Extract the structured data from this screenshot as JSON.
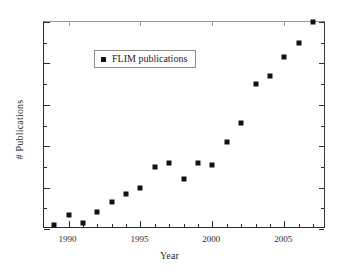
{
  "chart_data": {
    "type": "scatter",
    "title": "",
    "xlabel": "Year",
    "ylabel": "# Publications",
    "legend": [
      "FLIM publications"
    ],
    "legend_position": "top-left",
    "grid": false,
    "marker": "filled-square",
    "marker_color": "#111111",
    "xlim": [
      1988.3,
      2007.9
    ],
    "ylim": [
      0,
      100
    ],
    "x_major_ticks": [
      1990,
      1995,
      2000,
      2005
    ],
    "x_tick_labels": [
      "1990",
      "1995",
      "2000",
      "2005"
    ],
    "x_minor_tick_step": 1,
    "y_tick_labels": [],
    "y_axis_labeled": false,
    "y_major_tick_count": 5,
    "y_minor_tick_count": 5,
    "x": [
      1989,
      1990,
      1991,
      1992,
      1993,
      1994,
      1995,
      1996,
      1997,
      1998,
      1999,
      2000,
      2001,
      2002,
      2003,
      2004,
      2005,
      2006,
      2007
    ],
    "values": [
      2,
      7,
      3,
      8,
      13,
      17,
      20,
      30,
      32,
      24,
      32,
      31,
      42,
      51,
      70,
      74,
      83,
      90,
      100
    ],
    "points": [
      {
        "year": 1989,
        "value": 2
      },
      {
        "year": 1990,
        "value": 7
      },
      {
        "year": 1991,
        "value": 3
      },
      {
        "year": 1992,
        "value": 8
      },
      {
        "year": 1993,
        "value": 13
      },
      {
        "year": 1994,
        "value": 17
      },
      {
        "year": 1995,
        "value": 20
      },
      {
        "year": 1996,
        "value": 30
      },
      {
        "year": 1997,
        "value": 32
      },
      {
        "year": 1998,
        "value": 24
      },
      {
        "year": 1999,
        "value": 32
      },
      {
        "year": 2000,
        "value": 31
      },
      {
        "year": 2001,
        "value": 42
      },
      {
        "year": 2002,
        "value": 51
      },
      {
        "year": 2003,
        "value": 70
      },
      {
        "year": 2004,
        "value": 74
      },
      {
        "year": 2005,
        "value": 83
      },
      {
        "year": 2006,
        "value": 90
      },
      {
        "year": 2007,
        "value": 100
      }
    ]
  },
  "axes": {
    "x_title": "Year",
    "y_title": "# Publications"
  },
  "legend": {
    "entry_label": "FLIM publications"
  },
  "colors": {
    "marker": "#111111",
    "frame": "#2b2b2b",
    "text": "#2b2b2b",
    "background": "#ffffff"
  }
}
